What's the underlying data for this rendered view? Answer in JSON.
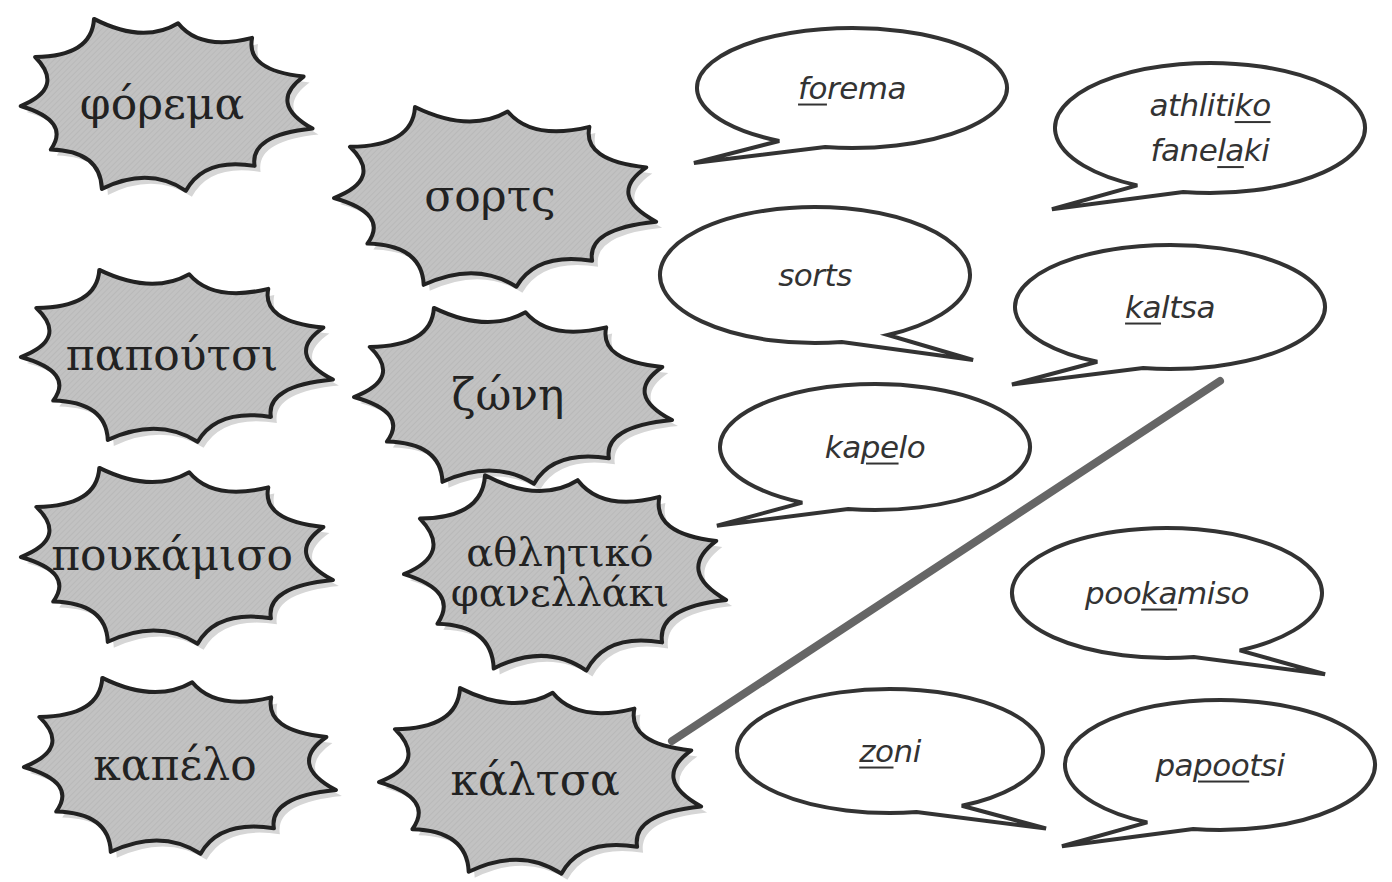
{
  "greek_words": [
    {
      "id": "forema",
      "text": "φόρεμα",
      "cx": 162,
      "cy": 104,
      "rx": 145,
      "ry": 88,
      "fs": 44
    },
    {
      "id": "sorts",
      "text": "σορτς",
      "cx": 490,
      "cy": 196,
      "rx": 160,
      "ry": 92,
      "fs": 44
    },
    {
      "id": "papoutsi",
      "text": "παπούτσι",
      "cx": 172,
      "cy": 355,
      "rx": 155,
      "ry": 88,
      "fs": 44
    },
    {
      "id": "zoni",
      "text": "ζώνη",
      "cx": 508,
      "cy": 395,
      "rx": 158,
      "ry": 90,
      "fs": 44
    },
    {
      "id": "pookamiso",
      "text": "πουκάμισο",
      "cx": 172,
      "cy": 555,
      "rx": 155,
      "ry": 90,
      "fs": 44
    },
    {
      "id": "athlitiko",
      "text": "αθλητικό\nφανελλάκι",
      "cx": 560,
      "cy": 572,
      "rx": 160,
      "ry": 100,
      "fs": 40
    },
    {
      "id": "kapelo",
      "text": "καπέλο",
      "cx": 175,
      "cy": 765,
      "rx": 155,
      "ry": 90,
      "fs": 44
    },
    {
      "id": "kaltsa",
      "text": "κάλτσα",
      "cx": 535,
      "cy": 780,
      "rx": 160,
      "ry": 95,
      "fs": 44
    }
  ],
  "transliterations": [
    {
      "id": "forema",
      "parts": [
        {
          "t": "fo",
          "u": true
        },
        {
          "t": "rema",
          "u": false
        }
      ],
      "cx": 852,
      "cy": 88,
      "rx": 155,
      "ry": 60,
      "tail": "bl"
    },
    {
      "id": "athlitiko",
      "parts": [
        {
          "t": "athliti",
          "u": false
        },
        {
          "t": "ko",
          "u": true
        },
        {
          "t": "\n",
          "u": false
        },
        {
          "t": "fane",
          "u": false
        },
        {
          "t": "la",
          "u": true
        },
        {
          "t": "ki",
          "u": false
        }
      ],
      "cx": 1210,
      "cy": 128,
      "rx": 155,
      "ry": 65,
      "tail": "bl"
    },
    {
      "id": "sorts",
      "parts": [
        {
          "t": "sorts",
          "u": false
        }
      ],
      "cx": 815,
      "cy": 275,
      "rx": 155,
      "ry": 68,
      "tail": "br"
    },
    {
      "id": "kaltsa",
      "parts": [
        {
          "t": "ka",
          "u": true
        },
        {
          "t": "ltsa",
          "u": false
        }
      ],
      "cx": 1170,
      "cy": 307,
      "rx": 155,
      "ry": 62,
      "tail": "bl"
    },
    {
      "id": "kapelo",
      "parts": [
        {
          "t": "ka",
          "u": false
        },
        {
          "t": "pe",
          "u": true
        },
        {
          "t": "lo",
          "u": false
        }
      ],
      "cx": 875,
      "cy": 447,
      "rx": 155,
      "ry": 63,
      "tail": "bl"
    },
    {
      "id": "pookamiso",
      "parts": [
        {
          "t": "poo",
          "u": false
        },
        {
          "t": "ka",
          "u": true
        },
        {
          "t": "miso",
          "u": false
        }
      ],
      "cx": 1167,
      "cy": 593,
      "rx": 155,
      "ry": 65,
      "tail": "br"
    },
    {
      "id": "zoni",
      "parts": [
        {
          "t": "zo",
          "u": true
        },
        {
          "t": "ni",
          "u": false
        }
      ],
      "cx": 890,
      "cy": 751,
      "rx": 153,
      "ry": 62,
      "tail": "br"
    },
    {
      "id": "papoutsi",
      "parts": [
        {
          "t": "pa",
          "u": false
        },
        {
          "t": "poo",
          "u": true
        },
        {
          "t": "tsi",
          "u": false
        }
      ],
      "cx": 1220,
      "cy": 765,
      "rx": 155,
      "ry": 65,
      "tail": "bl"
    }
  ],
  "connections": [
    {
      "from": "kaltsa",
      "to": "kaltsa",
      "x1": 672,
      "y1": 741,
      "x2": 1220,
      "y2": 381,
      "color": "#666666"
    }
  ],
  "colors": {
    "burst_fill": "#bdbdbd",
    "burst_stroke": "#222222",
    "bubble_stroke": "#333333",
    "line": "#666666"
  }
}
